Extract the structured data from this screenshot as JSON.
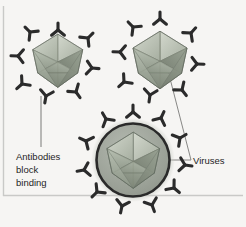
{
  "figure": {
    "kind": "biology-diagram",
    "background_color": "#f6f5f3",
    "border_color": "#c9c9c7",
    "labels": {
      "antibodies": {
        "lines": [
          "Antibodies",
          "block",
          "binding"
        ],
        "line1": "Antibodies",
        "line2": "block",
        "line3": "binding",
        "x": 16,
        "y": 157,
        "color": "#1e1e1e"
      },
      "viruses": {
        "text": "Viruses",
        "x": 193,
        "y": 163,
        "color": "#1e1e1e"
      }
    },
    "leader_lines": [
      {
        "name": "antibody-leader",
        "x1": 41,
        "y1": 95,
        "x2": 41,
        "y2": 146
      },
      {
        "name": "virus-leader-top-right",
        "x1": 165,
        "y1": 59,
        "x2": 191,
        "y2": 160
      },
      {
        "name": "virus-leader-bottom",
        "x1": 139,
        "y1": 160,
        "x2": 191,
        "y2": 160
      }
    ],
    "viruses": [
      {
        "name": "virus-top-left",
        "cx": 58,
        "cy": 62,
        "r": 27,
        "enveloped": false,
        "capsid_color": "#9aa394",
        "antibody_count": 8
      },
      {
        "name": "virus-top-right",
        "cx": 160,
        "cy": 60,
        "r": 29,
        "enveloped": false,
        "capsid_color": "#9aa394",
        "antibody_count": 8
      },
      {
        "name": "virus-bottom-enveloped",
        "cx": 133,
        "cy": 160,
        "r": 38,
        "enveloped": true,
        "envelope_color": "#2a2a2a",
        "envelope_fill": "#9a9f96",
        "capsid_color": "#98a192",
        "antibody_count": 11
      }
    ],
    "antibody_color": "#2b2b2b",
    "capsid_palette": {
      "light": "#cfd4c9",
      "mid": "#a8b0a2",
      "dark": "#858e80",
      "darker": "#6e766a",
      "edge": "#5d655a"
    }
  }
}
